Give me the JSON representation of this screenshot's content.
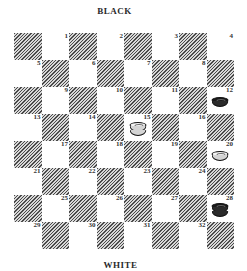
{
  "labels": {
    "top": "BLACK",
    "bottom": "WHITE"
  },
  "board": {
    "rows": 8,
    "cols": 8,
    "squares": [
      {
        "n": "1"
      },
      {
        "n": "2"
      },
      {
        "n": "3"
      },
      {
        "n": "4"
      },
      {
        "n": "5"
      },
      {
        "n": "6"
      },
      {
        "n": "7"
      },
      {
        "n": "8"
      },
      {
        "n": "9"
      },
      {
        "n": "10"
      },
      {
        "n": "11"
      },
      {
        "n": "12"
      },
      {
        "n": "13"
      },
      {
        "n": "14"
      },
      {
        "n": "15"
      },
      {
        "n": "16"
      },
      {
        "n": "17"
      },
      {
        "n": "18"
      },
      {
        "n": "19"
      },
      {
        "n": "20"
      },
      {
        "n": "21"
      },
      {
        "n": "22"
      },
      {
        "n": "23"
      },
      {
        "n": "24"
      },
      {
        "n": "25"
      },
      {
        "n": "26"
      },
      {
        "n": "27"
      },
      {
        "n": "28"
      },
      {
        "n": "29"
      },
      {
        "n": "30"
      },
      {
        "n": "31"
      },
      {
        "n": "32"
      }
    ]
  },
  "pieces": [
    {
      "square": 12,
      "color": "black",
      "type": "man"
    },
    {
      "square": 15,
      "color": "white",
      "type": "king"
    },
    {
      "square": 20,
      "color": "white",
      "type": "man"
    },
    {
      "square": 28,
      "color": "black",
      "type": "king"
    }
  ]
}
